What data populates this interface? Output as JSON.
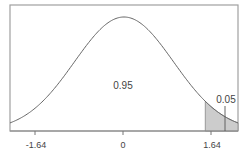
{
  "chart_data": {
    "type": "area",
    "title": "",
    "xlabel": "",
    "ylabel": "",
    "x_ticks": [
      "-1.64",
      "0",
      "1.64"
    ],
    "x_tick_values": [
      -1.64,
      0,
      1.64
    ],
    "xlim": [
      -2.3,
      2.3
    ],
    "grid": false,
    "legend": null,
    "series": [
      {
        "name": "standard normal density",
        "distribution": "N(0,1)",
        "mean": 0,
        "sd": 1
      }
    ],
    "regions": [
      {
        "name": "central area",
        "from": -2.3,
        "to": 1.64,
        "area": 0.95,
        "label": "0.95",
        "shaded": false
      },
      {
        "name": "right tail",
        "from": 1.64,
        "to": 2.3,
        "area": 0.05,
        "label": "0.05",
        "shaded": true
      }
    ],
    "annotations": [
      {
        "text": "0.95",
        "position": "center under curve"
      },
      {
        "text": "0.05",
        "position": "above right tail with leader line"
      }
    ]
  },
  "labels": {
    "center_area": "0.95",
    "tail_area": "0.05",
    "tick_neg": "-1.64",
    "tick_zero": "0",
    "tick_pos": "1.64"
  },
  "colors": {
    "frame": "#999999",
    "curve": "#666666",
    "shade": "#cccccc",
    "text": "#444444"
  }
}
